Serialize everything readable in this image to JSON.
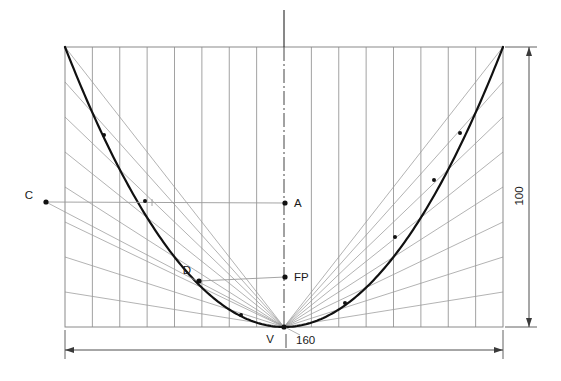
{
  "figure": {
    "type": "engineering-drawing",
    "background_color": "#ffffff",
    "width": 561,
    "height": 381
  },
  "labels": {
    "point_c": "C",
    "point_a": "A",
    "point_fp": "FP",
    "point_d": "D",
    "point_v": "V",
    "dim_height": "100",
    "dim_width": "160"
  },
  "colors": {
    "curve": "#111111",
    "grid": "#8a8a8a",
    "construction": "#9a9a9a",
    "frame": "#8a8a8a",
    "dimension": "#3a3a3a",
    "text": "#1a1a1a"
  },
  "geometry": {
    "frame": {
      "left": 65,
      "right": 503,
      "top": 47,
      "bottom": 327
    },
    "vertex": {
      "x": 284,
      "y": 327
    },
    "axis_x": 284,
    "grid_divisions": 16,
    "edge_divisions": 8,
    "points": [
      {
        "name": "C",
        "x": 46,
        "y": 202,
        "label_dx": -13,
        "label_dy": -3
      },
      {
        "name": "A",
        "x": 285,
        "y": 203,
        "label_dx": 9,
        "label_dy": 4
      },
      {
        "name": "FP",
        "x": 285,
        "y": 277,
        "label_dx": 9,
        "label_dy": 4
      },
      {
        "name": "D",
        "x": 199,
        "y": 281,
        "label_dx": -12,
        "label_dy": -7
      },
      {
        "name": "V",
        "x": 284,
        "y": 327,
        "label_dx": -14,
        "label_dy": 16
      }
    ],
    "curve_markers_left": [
      {
        "x": 104,
        "y": 135
      },
      {
        "x": 145,
        "y": 201
      },
      {
        "x": 199,
        "y": 281
      },
      {
        "x": 241,
        "y": 315
      }
    ],
    "curve_markers_right": [
      {
        "x": 460,
        "y": 133
      },
      {
        "x": 434,
        "y": 180
      },
      {
        "x": 395,
        "y": 237
      },
      {
        "x": 345,
        "y": 303
      }
    ]
  },
  "dimensions": {
    "vertical": {
      "value": "100",
      "x": 529,
      "y_top": 47,
      "y_bottom": 327,
      "label_x": 523,
      "label_y": 196
    },
    "horizontal": {
      "value": "160",
      "y": 350,
      "x_left": 65,
      "x_right": 503,
      "label_x": 296,
      "label_y": 344
    }
  }
}
